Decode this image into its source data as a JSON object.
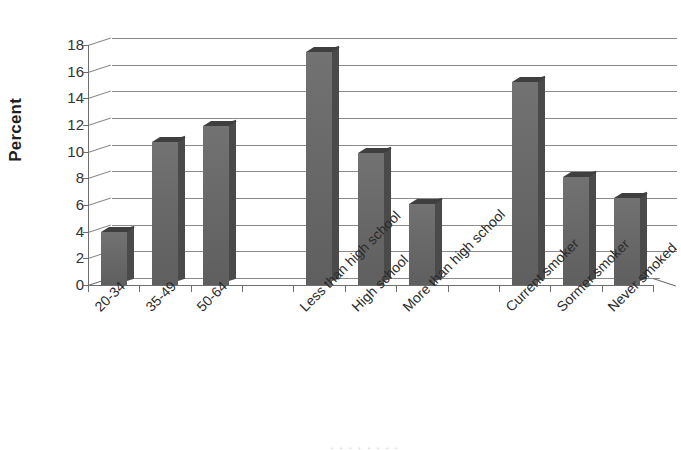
{
  "chart_data": {
    "type": "bar",
    "title": "",
    "xlabel": "",
    "ylabel": "Percent",
    "ylim": [
      0,
      18
    ],
    "ytick_step": 2,
    "yticks": [
      18,
      16,
      14,
      12,
      10,
      8,
      6,
      4,
      2,
      0
    ],
    "grid": true,
    "legend": "none",
    "style": "3d-column",
    "bar_color": "#6b6b6b",
    "bar_side_color": "#4a4a4a",
    "bar_top_color": "#3f3f3f",
    "gridline_color": "#8a8a8a",
    "axis_color": "#6e6e6e",
    "categories": [
      "20-34",
      "35-49",
      "50-64",
      "Less than high school",
      "High school",
      "More than high school",
      "Current smoker",
      "Sormer smoker",
      "Never smoked"
    ],
    "values": [
      4.0,
      10.7,
      11.9,
      17.5,
      9.9,
      6.1,
      15.2,
      8.1,
      6.5
    ],
    "group_gaps_after": [
      2,
      5
    ],
    "bars": [
      {
        "label": "20-34",
        "value": 4.0,
        "slot": 0
      },
      {
        "label": "35-49",
        "value": 10.7,
        "slot": 1
      },
      {
        "label": "50-64",
        "value": 11.9,
        "slot": 2
      },
      {
        "label": "Less than high school",
        "value": 17.5,
        "slot": 4
      },
      {
        "label": "High school",
        "value": 9.9,
        "slot": 5
      },
      {
        "label": "More than high school",
        "value": 6.1,
        "slot": 6
      },
      {
        "label": "Current smoker",
        "value": 15.2,
        "slot": 8
      },
      {
        "label": "Sormer smoker",
        "value": 8.1,
        "slot": 9
      },
      {
        "label": "Never smoked",
        "value": 6.5,
        "slot": 10
      }
    ]
  },
  "axis": {
    "y_title": "Percent"
  },
  "footer": {
    "cut_text": ". . . . . . . ."
  }
}
